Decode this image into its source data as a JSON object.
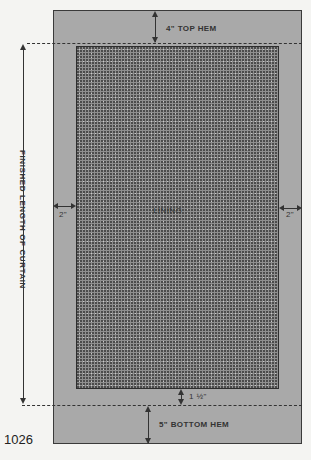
{
  "figure": {
    "number": "1026",
    "labels": {
      "top_hem": "4\" TOP HEM",
      "bottom_hem": "5\" BOTTOM HEM",
      "lining": "LINING",
      "left_margin": "2\"",
      "right_margin": "2\"",
      "lining_bottom_gap": "1 ½\"",
      "finished_length": "FINISHED LENGTH OF CURTAIN"
    },
    "colors": {
      "fabric": "#a9a9a9",
      "lining": "#8f8f8f",
      "lines": "#333333"
    }
  }
}
